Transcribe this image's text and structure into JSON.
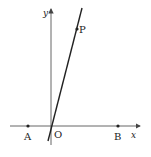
{
  "diagram": {
    "axes": {
      "x_label": "x",
      "y_label": "y",
      "origin_label": "O"
    },
    "points": [
      {
        "label": "A",
        "x": 28,
        "y": 126
      },
      {
        "label": "B",
        "x": 118,
        "y": 126
      },
      {
        "label": "P",
        "x": 77,
        "y": 29
      }
    ],
    "line": {
      "x1": 48,
      "y1": 141,
      "x2": 82,
      "y2": 8
    },
    "colors": {
      "stroke": "#222222",
      "axis": "#555555",
      "background": "#ffffff"
    }
  }
}
